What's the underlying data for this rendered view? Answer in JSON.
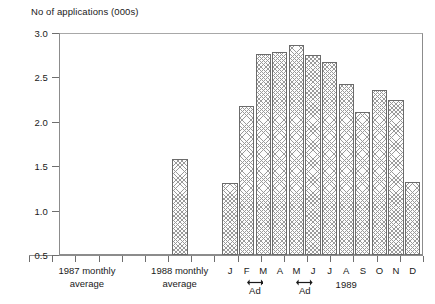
{
  "chart_data": {
    "type": "bar",
    "title": "",
    "ylabel": "No of applications (000s)",
    "xlabel": "",
    "ylim": [
      0.5,
      3.0
    ],
    "ytick_values": [
      3.0,
      2.5,
      2.0,
      1.5,
      1.0,
      0.5
    ],
    "ytick_labels": [
      "3.0",
      "2.5",
      "2.0",
      "1.5",
      "1.0",
      "0.5"
    ],
    "grid": false,
    "legend": null,
    "categories": [
      "1987 monthly average",
      "1988 monthly average",
      "J",
      "F",
      "M",
      "A",
      "M",
      "J",
      "J",
      "A",
      "S",
      "O",
      "N",
      "D"
    ],
    "values": [
      null,
      1.58,
      1.31,
      2.18,
      2.76,
      2.79,
      2.87,
      2.75,
      2.67,
      2.43,
      2.11,
      2.36,
      2.24,
      1.32
    ],
    "annotations": [
      {
        "label": "Ad",
        "spans": [
          "F",
          "M"
        ]
      },
      {
        "label": "Ad",
        "spans": [
          "M",
          "J"
        ]
      },
      {
        "label": "1989"
      }
    ]
  },
  "axis": {
    "y_title": "No of applications (000s)",
    "y_ticks": [
      {
        "label": "3.0",
        "value": 3.0
      },
      {
        "label": "2.5",
        "value": 2.5
      },
      {
        "label": "2.0",
        "value": 2.0
      },
      {
        "label": "1.5",
        "value": 1.5
      },
      {
        "label": "1.0",
        "value": 1.0
      },
      {
        "label": "0.5",
        "value": 0.5
      }
    ]
  },
  "groups": [
    {
      "line1": "1987 monthly",
      "line2": "average"
    },
    {
      "line1": "1988 monthly",
      "line2": "average"
    }
  ],
  "months": [
    {
      "label": "J"
    },
    {
      "label": "F"
    },
    {
      "label": "M"
    },
    {
      "label": "A"
    },
    {
      "label": "M"
    },
    {
      "label": "J"
    },
    {
      "label": "J"
    },
    {
      "label": "A"
    },
    {
      "label": "S"
    },
    {
      "label": "O"
    },
    {
      "label": "N"
    },
    {
      "label": "D"
    }
  ],
  "annotations": {
    "ad_first": "Ad",
    "ad_second": "Ad",
    "year": "1989"
  },
  "colors": {
    "axis": "#8c8c8c",
    "bar_outline": "#6b6b6b",
    "bar_hatch": "#9a9a9a",
    "text": "#1a1a1a"
  }
}
